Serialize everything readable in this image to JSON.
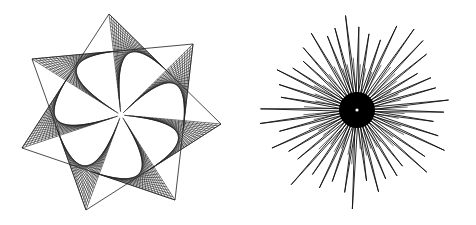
{
  "figures": [
    {
      "name": "seven-point-string-art-star",
      "kind": "ruled-triangle-star",
      "center": [
        121,
        115
      ],
      "vertices": [
        [
          109,
          14
        ],
        [
          193,
          44
        ],
        [
          221,
          124
        ],
        [
          175,
          200
        ],
        [
          86,
          210
        ],
        [
          22,
          148
        ],
        [
          32,
          59
        ]
      ],
      "line_color": "#222222",
      "lines_per_face": 26,
      "center_hole_color": "#ffffff"
    },
    {
      "name": "spiky-starburst",
      "kind": "radial-spikes",
      "center": [
        117,
        110
      ],
      "spike_count": 44,
      "outer_radius_min": 70,
      "outer_radius_max": 100,
      "core_radius": 18,
      "line_color": "#111111",
      "core_color": "#000000",
      "center_dot_color": "#ffffff"
    }
  ]
}
